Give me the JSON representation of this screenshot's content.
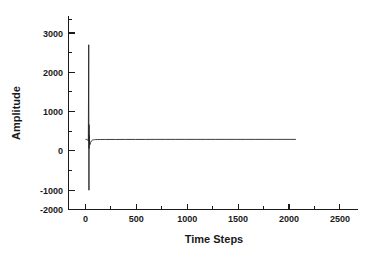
{
  "chart_data": {
    "type": "line",
    "title": "",
    "xlabel": "Time Steps",
    "ylabel": "Amplitude",
    "xlim": [
      -170,
      2720
    ],
    "ylim": [
      -2000,
      3520
    ],
    "grid": false,
    "legend": null,
    "xticks": [
      0,
      500,
      1000,
      1500,
      2000,
      2500
    ],
    "xtick_labels": [
      "0",
      "500",
      "1000",
      "1500",
      "2000",
      "2500"
    ],
    "x_minor_ticks": [
      250,
      750,
      1250,
      1750,
      2250
    ],
    "yticks": [
      -2000,
      -1000,
      0,
      1000,
      2000,
      3000
    ],
    "ytick_labels": [
      "-2000",
      "-1000",
      "0",
      "1000",
      "2000",
      "3000"
    ],
    "y_minor_ticks": [
      -1500,
      -500,
      500,
      1500,
      2500,
      3500
    ],
    "series": [
      {
        "name": "signal",
        "color": "#262626",
        "x": [
          0,
          10,
          20,
          28,
          32,
          34,
          35,
          36,
          38,
          40,
          44,
          50,
          60,
          70,
          80,
          90,
          100,
          120,
          150,
          200,
          300,
          400,
          500,
          600,
          700,
          800,
          900,
          1000,
          1100,
          1200,
          1300,
          1400,
          1500,
          1600,
          1700,
          1800,
          1900,
          2000,
          2050,
          2100
        ],
        "y": [
          0,
          0,
          -10,
          -40,
          2700,
          -1450,
          420,
          -260,
          120,
          -70,
          -150,
          -90,
          -40,
          -20,
          -12,
          -8,
          -6,
          -4,
          -3,
          -2,
          -2,
          -1,
          -1,
          -1,
          0,
          0,
          0,
          0,
          0,
          0,
          0,
          0,
          0,
          0,
          0,
          0,
          0,
          0,
          0,
          0
        ]
      }
    ],
    "spike": {
      "time": 35,
      "peak_positive": 2700,
      "peak_negative": -1450
    },
    "signal_end": 2100
  }
}
